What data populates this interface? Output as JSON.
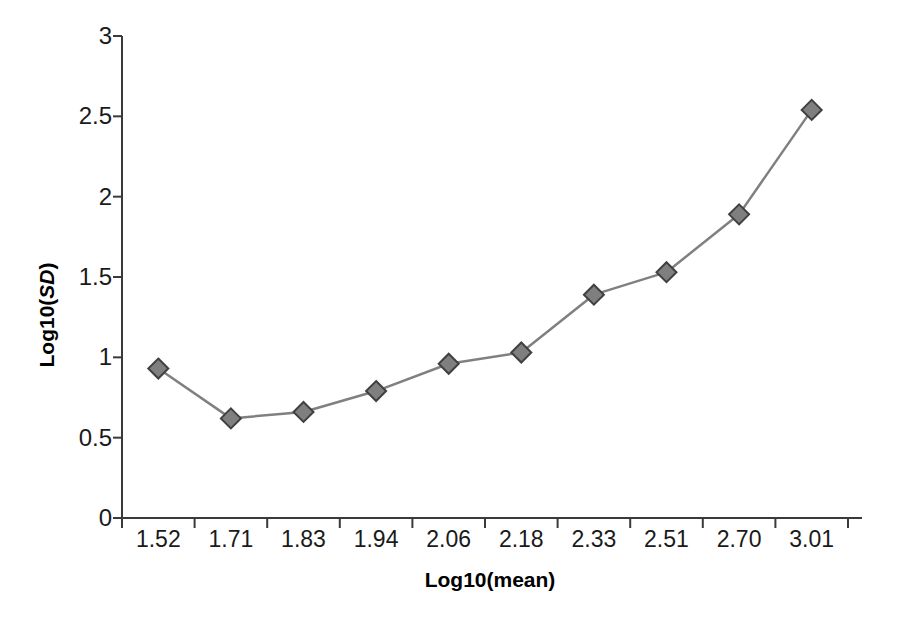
{
  "chart_data": {
    "type": "line",
    "title": "",
    "subtitle": "",
    "xlabel": "Log10(mean)",
    "ylabel": "Log10(SD)",
    "ylabel_parts": {
      "prefix": "Log10(",
      "italic": "SD",
      "suffix": ")"
    },
    "categories": [
      "1.52",
      "1.71",
      "1.83",
      "1.94",
      "2.06",
      "2.18",
      "2.33",
      "2.51",
      "2.70",
      "3.01"
    ],
    "values": [
      0.93,
      0.62,
      0.66,
      0.79,
      0.96,
      1.03,
      1.39,
      1.53,
      1.89,
      2.54
    ],
    "series": [
      {
        "name": "",
        "values": [
          0.93,
          0.62,
          0.66,
          0.79,
          0.96,
          1.03,
          1.39,
          1.53,
          1.89,
          2.54
        ]
      }
    ],
    "ylim": [
      0,
      3
    ],
    "yticks": [
      0,
      0.5,
      1,
      1.5,
      2,
      2.5,
      3
    ],
    "ytick_labels": [
      "0",
      "0.5",
      "1",
      "1.5",
      "2",
      "2.5",
      "3"
    ],
    "grid": false,
    "legend": false,
    "legend_position": "none",
    "marker": "diamond",
    "colors": {
      "line": "#808080",
      "marker_fill": "#7f7f7f",
      "marker_stroke": "#404040",
      "axis": "#3a3a3a",
      "text": "#1a1a1a",
      "background": "#ffffff"
    }
  }
}
